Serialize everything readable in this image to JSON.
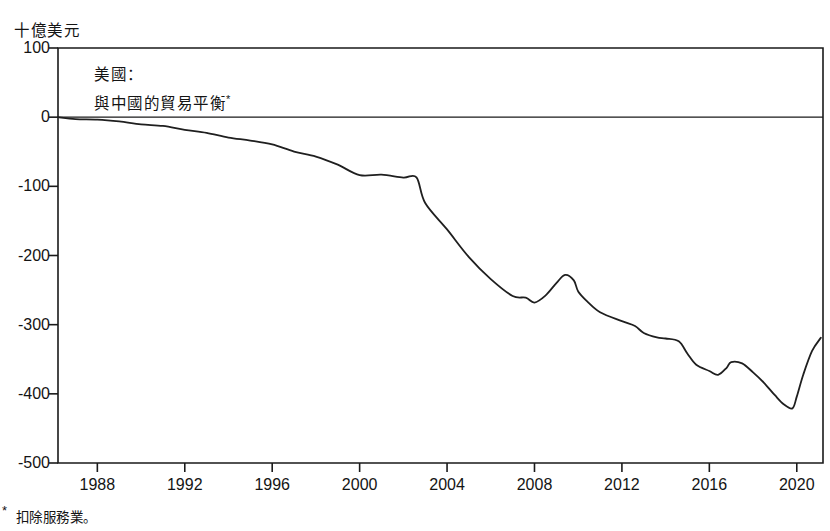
{
  "figure": {
    "unit_label": "十億美元",
    "title_line1": "美國：",
    "title_line2": "與中國的貿易平衡",
    "title_superscript": "*",
    "footnote_mark": "*",
    "footnote_text": "扣除服務業。",
    "line_color": "#1f1f1f",
    "axis_color": "#1a1a1a",
    "background_color": "#ffffff"
  },
  "chart_data": {
    "type": "line",
    "xlabel": "",
    "ylabel": "十億美元",
    "ylim": [
      -500,
      100
    ],
    "xlim": [
      1986.2,
      2021.2
    ],
    "grid": false,
    "legend": "none",
    "y_ticks": [
      100,
      0,
      -100,
      -200,
      -300,
      -400,
      -500
    ],
    "y_tick_labels": [
      "100",
      "0",
      "-100",
      "-200",
      "-300",
      "-400",
      "-500"
    ],
    "x_ticks": [
      1988,
      1992,
      1996,
      2000,
      2004,
      2008,
      2012,
      2016,
      2020
    ],
    "x_tick_labels": [
      "1988",
      "1992",
      "1996",
      "2000",
      "2004",
      "2008",
      "2012",
      "2016",
      "2020"
    ],
    "zero_line": 0,
    "series": [
      {
        "name": "US trade balance with China (goods)",
        "x": [
          1986.2,
          1987,
          1988,
          1989,
          1990,
          1991,
          1992,
          1993,
          1994,
          1995,
          1996,
          1997,
          1998,
          1999,
          2000,
          2001,
          2002,
          2002.6,
          2003,
          2004,
          2005,
          2006,
          2007,
          2007.6,
          2008,
          2008.5,
          2009,
          2009.4,
          2009.8,
          2010,
          2010.4,
          2011,
          2012,
          2012.6,
          2013,
          2013.6,
          2014,
          2014.6,
          2015,
          2015.4,
          2016,
          2016.4,
          2016.8,
          2017,
          2017.5,
          2018,
          2018.5,
          2019,
          2019.4,
          2019.8,
          2020,
          2020.3,
          2020.7,
          2021.1
        ],
        "y": [
          0,
          -2.8,
          -3.5,
          -6.2,
          -10.4,
          -12.7,
          -18.3,
          -22.8,
          -29.5,
          -33.8,
          -39.5,
          -49.7,
          -56.9,
          -68.7,
          -83.8,
          -83.1,
          -87.3,
          -87.0,
          -124.1,
          -162.3,
          -202.3,
          -234.1,
          -258.5,
          -261.0,
          -268.0,
          -258.0,
          -240.0,
          -228.0,
          -236.0,
          -252.0,
          -266.0,
          -282.0,
          -295.0,
          -302.0,
          -312.0,
          -318.5,
          -320.0,
          -324.0,
          -342.0,
          -358.0,
          -367.0,
          -372.5,
          -362.0,
          -354.0,
          -356.0,
          -369.0,
          -384.0,
          -402.0,
          -415.0,
          -421.0,
          -404.0,
          -372.0,
          -338.0,
          -319.0
        ]
      }
    ]
  }
}
